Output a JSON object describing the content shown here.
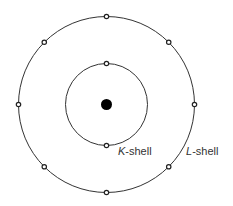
{
  "diagram": {
    "center": {
      "x": 106.5,
      "y": 104.5
    },
    "nucleus": {
      "radius": 5.5,
      "color": "#000000"
    },
    "electron": {
      "radius": 2.2,
      "stroke": "#222222",
      "fill": "#ffffff"
    },
    "shell_stroke": "#333333",
    "shells": [
      {
        "name": "K",
        "label_letter": "K",
        "label_suffix": "-shell",
        "radius": 41,
        "electron_count": 2,
        "electron_angles_deg": [
          -90,
          90
        ],
        "label_position": {
          "x": 118,
          "y": 146
        }
      },
      {
        "name": "L",
        "label_letter": "L",
        "label_suffix": "-shell",
        "radius": 88,
        "electron_count": 8,
        "electron_angles_deg": [
          -90,
          -45,
          0,
          45,
          90,
          135,
          180,
          225
        ],
        "label_position": {
          "x": 186,
          "y": 146
        }
      }
    ]
  }
}
